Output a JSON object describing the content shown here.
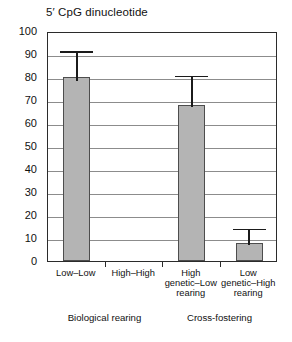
{
  "chart_data": {
    "type": "bar",
    "title": "5′ CpG dinucleotide",
    "xlabel": "",
    "ylabel": "",
    "ylim": [
      0,
      100
    ],
    "ytick_step": 10,
    "yticks": [
      "100",
      "90",
      "80",
      "70",
      "60",
      "50",
      "40",
      "30",
      "20",
      "10",
      "0"
    ],
    "grid": true,
    "legend": "none",
    "categories": [
      "Low–Low",
      "High–High",
      "High genetic–Low rearing",
      "Low genetic–High rearing"
    ],
    "category_label_lines": [
      [
        "Low–Low"
      ],
      [
        "High–High"
      ],
      [
        "High",
        "genetic–Low",
        "rearing"
      ],
      [
        "Low",
        "genetic–High",
        "rearing"
      ]
    ],
    "values": [
      80,
      null,
      68,
      8
    ],
    "error_upper": [
      92,
      null,
      81.5,
      15
    ],
    "error_lower": [
      79,
      null,
      68,
      8
    ],
    "groups": [
      {
        "label": "Biological rearing",
        "categories": [
          "Low–Low",
          "High–High"
        ]
      },
      {
        "label": "Cross-fostering",
        "categories": [
          "High genetic–Low rearing",
          "Low genetic–High rearing"
        ]
      }
    ],
    "colors": {
      "bar_fill": "#b4b4b4",
      "bar_border": "#4d4d4d",
      "errorbar": "#1b1b1b",
      "gridline": "#8c8c8c",
      "axis": "#2b2b2b",
      "text": "#111111",
      "background": "#ffffff"
    }
  }
}
